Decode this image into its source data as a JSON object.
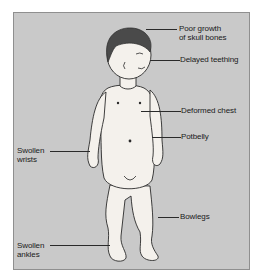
{
  "diagram": {
    "colors": {
      "background": "#c9c9c9",
      "frame_border": "#8f8f8f",
      "skin": "#f4f1ec",
      "hair": "#4a4a4a",
      "outline": "#2a2a2a",
      "text": "#1a1a1a"
    },
    "labels": [
      {
        "id": "skull",
        "text": "Poor growth\nof skull bones"
      },
      {
        "id": "teething",
        "text": "Delayed teething"
      },
      {
        "id": "chest",
        "text": "Deformed chest"
      },
      {
        "id": "potbelly",
        "text": "Potbelly"
      },
      {
        "id": "wrists",
        "text": "Swollen\nwrists"
      },
      {
        "id": "bowlegs",
        "text": "Bowlegs"
      },
      {
        "id": "ankles",
        "text": "Swollen\nankles"
      }
    ]
  }
}
